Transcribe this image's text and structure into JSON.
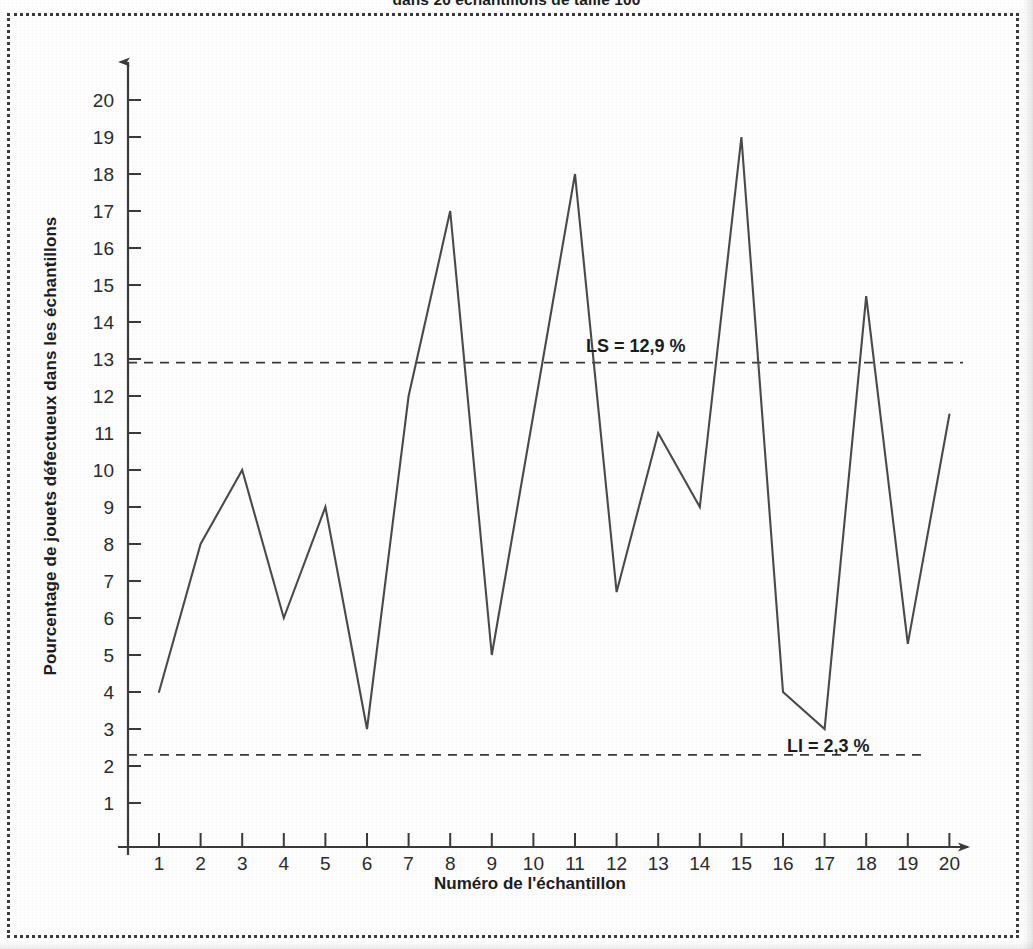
{
  "figure": {
    "title_fragment": "dans 20 échantillons de taille 100",
    "frame_style": "dotted-border"
  },
  "chart_data": {
    "type": "line",
    "title": "dans 20 échantillons de taille 100",
    "xlabel": "Numéro de l'échantillon",
    "ylabel": "Pourcentage de jouets défectueux dans les échantillons",
    "x": [
      1,
      2,
      3,
      4,
      5,
      6,
      7,
      8,
      9,
      10,
      11,
      12,
      13,
      14,
      15,
      16,
      17,
      18,
      19,
      20
    ],
    "values": [
      4,
      8,
      10,
      6,
      9,
      3,
      12,
      17,
      5,
      11.5,
      18,
      6.7,
      11,
      9,
      19,
      4,
      3,
      14.7,
      5.3,
      11.5
    ],
    "xlim": [
      0,
      21
    ],
    "ylim": [
      0,
      21
    ],
    "xticks": [
      "1",
      "2",
      "3",
      "4",
      "5",
      "6",
      "7",
      "8",
      "9",
      "10",
      "11",
      "12",
      "13",
      "14",
      "15",
      "16",
      "17",
      "18",
      "19",
      "20"
    ],
    "yticks": [
      "1",
      "2",
      "3",
      "4",
      "5",
      "6",
      "7",
      "8",
      "9",
      "10",
      "11",
      "12",
      "13",
      "14",
      "15",
      "16",
      "17",
      "18",
      "19",
      "20"
    ],
    "grid": false,
    "legend": "none",
    "series_color": "#4a4a4a",
    "annotations": [
      {
        "name": "upper-limit",
        "label": "LS = 12,9 %",
        "value": 12.9,
        "style": "dashed"
      },
      {
        "name": "lower-limit",
        "label": "LI = 2,3 %",
        "value": 2.3,
        "style": "dashed"
      }
    ]
  },
  "axes": {
    "y_axis_name": "y-axis",
    "x_axis_name": "x-axis",
    "arrowheads": true
  }
}
